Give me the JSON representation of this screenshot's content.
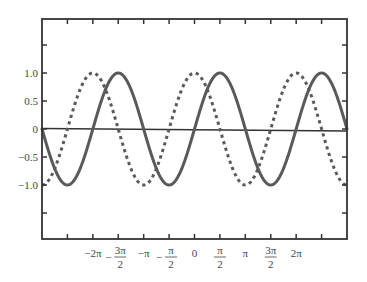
{
  "chart_data": {
    "type": "line",
    "title": "",
    "xlabel": "",
    "ylabel": "",
    "xlim": [
      -9.42478,
      9.42478
    ],
    "ylim": [
      -2.0,
      2.0
    ],
    "grid": false,
    "legend": null,
    "x_ticks": [
      {
        "value": -7.85398,
        "label": ""
      },
      {
        "value": -6.28319,
        "label": "−2π"
      },
      {
        "value": -4.71239,
        "label": "3π/2",
        "num": "3π",
        "den": "2",
        "neg": true
      },
      {
        "value": -3.14159,
        "label": "−π"
      },
      {
        "value": -1.5708,
        "label": "π/2",
        "num": "π",
        "den": "2",
        "neg": true
      },
      {
        "value": 0,
        "label": "0"
      },
      {
        "value": 1.5708,
        "label": "π/2",
        "num": "π",
        "den": "2",
        "neg": false
      },
      {
        "value": 3.14159,
        "label": "π"
      },
      {
        "value": 4.71239,
        "label": "3π/2",
        "num": "3π",
        "den": "2",
        "neg": false
      },
      {
        "value": 6.28319,
        "label": "2π"
      },
      {
        "value": 7.85398,
        "label": ""
      }
    ],
    "y_ticks": [
      {
        "value": 1.5,
        "label": ""
      },
      {
        "value": 1.0,
        "label": "1.0"
      },
      {
        "value": 0.5,
        "label": "0.5"
      },
      {
        "value": 0,
        "label": "0"
      },
      {
        "value": -0.5,
        "label": "−0.5"
      },
      {
        "value": -1.0,
        "label": "−1.0"
      },
      {
        "value": -1.5,
        "label": ""
      }
    ],
    "series": [
      {
        "name": "sin x",
        "function": "sin",
        "style": "solid",
        "color": "#5a5a5a",
        "width": 3,
        "x": [
          -9.42,
          -7.85,
          -6.28,
          -4.71,
          -3.14,
          -1.57,
          0,
          1.57,
          3.14,
          4.71,
          6.28,
          7.85,
          9.42
        ],
        "y": [
          0,
          -1,
          0,
          1,
          0,
          -1,
          0,
          1,
          0,
          -1,
          0,
          1,
          0
        ]
      },
      {
        "name": "cos x",
        "function": "cos",
        "style": "dotted",
        "color": "#5a5a5a",
        "width": 3,
        "x": [
          -9.42,
          -7.85,
          -6.28,
          -4.71,
          -3.14,
          -1.57,
          0,
          1.57,
          3.14,
          4.71,
          6.28,
          7.85,
          9.42
        ],
        "y": [
          -1,
          0,
          1,
          0,
          -1,
          0,
          1,
          0,
          -1,
          0,
          1,
          0,
          -1
        ]
      }
    ],
    "zero_line": {
      "y": 0,
      "color": "#333333"
    }
  },
  "colors": {
    "frame": "#333333",
    "curve": "#5a5a5a",
    "text": "#444444"
  }
}
